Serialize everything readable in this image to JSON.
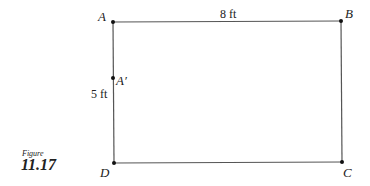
{
  "figure": {
    "caption_word": "Figure",
    "number": "11.17"
  },
  "points": {
    "A": "A",
    "B": "B",
    "C": "C",
    "D": "D",
    "A_prime": "A′"
  },
  "dimensions": {
    "top": "8 ft",
    "left": "5 ft"
  },
  "colors": {
    "line": "#555555",
    "point": "#111111"
  }
}
